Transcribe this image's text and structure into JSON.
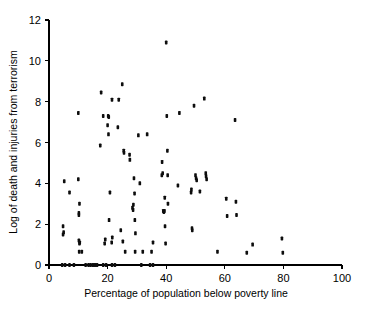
{
  "chart_data": {
    "type": "scatter",
    "title": "",
    "xlabel": "Percentage of population below poverty line",
    "ylabel": "Log of death and injuries from terrorism",
    "xlim": [
      0,
      100
    ],
    "ylim": [
      0,
      12
    ],
    "xticks": [
      0,
      20,
      40,
      60,
      80,
      100
    ],
    "yticks": [
      0,
      2,
      4,
      6,
      8,
      10,
      12
    ],
    "xtick_labels": [
      "0",
      "20",
      "40",
      "60",
      "80",
      "100"
    ],
    "ytick_labels": [
      "0",
      "2",
      "4",
      "6",
      "8",
      "10",
      "12"
    ],
    "grid": false,
    "legend": false,
    "legend_position": "none",
    "marker": "square",
    "marker_color": "#0d0d0d",
    "series": [
      {
        "name": "Countries",
        "points": [
          [
            4.5,
            0.0
          ],
          [
            5.5,
            0.0
          ],
          [
            7.0,
            0.0
          ],
          [
            8.5,
            0.0
          ],
          [
            12.5,
            0.0
          ],
          [
            13.5,
            0.0
          ],
          [
            14.2,
            0.0
          ],
          [
            15.0,
            0.0
          ],
          [
            15.7,
            0.0
          ],
          [
            16.4,
            0.0
          ],
          [
            18.5,
            0.0
          ],
          [
            19.5,
            0.0
          ],
          [
            21.5,
            0.0
          ],
          [
            22.5,
            0.0
          ],
          [
            31.5,
            0.0
          ],
          [
            34.5,
            0.0
          ],
          [
            35.5,
            0.0
          ],
          [
            4.8,
            1.9
          ],
          [
            4.8,
            1.5
          ],
          [
            5.0,
            1.6
          ],
          [
            5.2,
            4.1
          ],
          [
            7.0,
            3.55
          ],
          [
            10.0,
            4.2
          ],
          [
            10.2,
            2.55
          ],
          [
            10.2,
            2.45
          ],
          [
            10.4,
            3.0
          ],
          [
            10.0,
            7.45
          ],
          [
            10.2,
            1.2
          ],
          [
            10.4,
            1.05
          ],
          [
            10.5,
            1.1
          ],
          [
            10.3,
            0.65
          ],
          [
            11.2,
            0.65
          ],
          [
            17.5,
            5.85
          ],
          [
            17.8,
            8.45
          ],
          [
            18.5,
            7.3
          ],
          [
            19.0,
            1.05
          ],
          [
            19.2,
            1.25
          ],
          [
            20.0,
            6.85
          ],
          [
            20.2,
            7.3
          ],
          [
            20.4,
            7.25
          ],
          [
            20.3,
            6.4
          ],
          [
            20.5,
            2.2
          ],
          [
            20.8,
            3.55
          ],
          [
            21.5,
            8.1
          ],
          [
            21.6,
            1.35
          ],
          [
            21.4,
            1.1
          ],
          [
            23.5,
            6.75
          ],
          [
            23.8,
            8.1
          ],
          [
            24.5,
            1.7
          ],
          [
            25.0,
            8.85
          ],
          [
            25.2,
            1.15
          ],
          [
            25.5,
            5.6
          ],
          [
            25.6,
            5.5
          ],
          [
            26.0,
            0.65
          ],
          [
            27.5,
            5.4
          ],
          [
            27.6,
            5.15
          ],
          [
            28.5,
            2.8
          ],
          [
            28.7,
            2.7
          ],
          [
            28.8,
            2.95
          ],
          [
            29.0,
            4.25
          ],
          [
            29.2,
            3.5
          ],
          [
            29.3,
            2.2
          ],
          [
            29.5,
            1.55
          ],
          [
            29.4,
            0.65
          ],
          [
            30.5,
            6.35
          ],
          [
            31.0,
            4.0
          ],
          [
            32.0,
            0.65
          ],
          [
            33.5,
            6.4
          ],
          [
            35.0,
            0.65
          ],
          [
            35.5,
            1.1
          ],
          [
            38.5,
            4.4
          ],
          [
            38.6,
            5.05
          ],
          [
            38.8,
            4.5
          ],
          [
            39.0,
            2.65
          ],
          [
            39.2,
            2.6
          ],
          [
            39.4,
            2.65
          ],
          [
            39.5,
            3.3
          ],
          [
            39.6,
            1.9
          ],
          [
            39.8,
            1.05
          ],
          [
            40.0,
            10.9
          ],
          [
            40.2,
            7.3
          ],
          [
            40.4,
            5.6
          ],
          [
            40.5,
            4.4
          ],
          [
            40.6,
            3.0
          ],
          [
            44.0,
            3.9
          ],
          [
            44.5,
            7.45
          ],
          [
            48.5,
            3.55
          ],
          [
            48.6,
            3.7
          ],
          [
            48.8,
            1.8
          ],
          [
            48.9,
            1.7
          ],
          [
            49.5,
            7.8
          ],
          [
            50.0,
            4.4
          ],
          [
            50.2,
            4.25
          ],
          [
            50.4,
            4.15
          ],
          [
            51.5,
            3.6
          ],
          [
            53.0,
            8.15
          ],
          [
            53.5,
            4.5
          ],
          [
            53.6,
            4.35
          ],
          [
            53.8,
            4.2
          ],
          [
            57.5,
            0.65
          ],
          [
            60.5,
            3.25
          ],
          [
            60.8,
            2.4
          ],
          [
            63.5,
            7.1
          ],
          [
            63.8,
            3.1
          ],
          [
            64.0,
            2.45
          ],
          [
            67.5,
            0.6
          ],
          [
            69.5,
            1.0
          ],
          [
            79.5,
            1.3
          ],
          [
            79.8,
            0.6
          ]
        ]
      }
    ]
  },
  "axis": {
    "x_title": "Percentage of population below poverty line",
    "y_title": "Log of death and injuries from terrorism"
  }
}
